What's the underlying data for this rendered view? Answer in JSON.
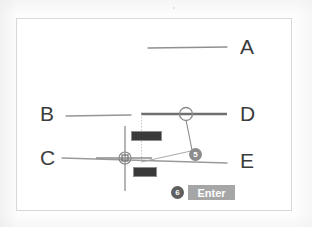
{
  "figure": {
    "background_color": "#ffffff",
    "line_color": "#8f8f8f",
    "highlight_line_color": "#6b6b6b",
    "label_color": "#3c3c3c",
    "marker_color": "#8c8c8c",
    "badge_background": "#3a3a3a",
    "button_background": "#a6a6a6"
  },
  "labels": [
    {
      "id": "A",
      "text": "A",
      "x": 240,
      "y": 44
    },
    {
      "id": "B",
      "text": "B",
      "x": 41,
      "y": 102
    },
    {
      "id": "C",
      "text": "C",
      "x": 41,
      "y": 146
    },
    {
      "id": "D",
      "text": "D",
      "x": 240,
      "y": 102
    },
    {
      "id": "E",
      "text": "E",
      "x": 240,
      "y": 146
    }
  ],
  "geometry": {
    "line_a": {
      "x1": 148,
      "y1": 48,
      "x2": 227,
      "y2": 47,
      "weight": 1.2
    },
    "line_b": {
      "x1": 66,
      "y1": 116,
      "x2": 131,
      "y2": 115,
      "weight": 1.2
    },
    "line_d": {
      "x1": 142,
      "y1": 114,
      "x2": 227,
      "y2": 114,
      "weight": 2.6
    },
    "line_ce": {
      "x1": 62,
      "y1": 159,
      "x2": 227,
      "y2": 163,
      "weight": 1.2
    },
    "cursor_vertical": {
      "x1": 125,
      "y1": 125,
      "x2": 125,
      "y2": 190,
      "weight": 1.2
    },
    "cursor_horizontal": {
      "x1": 95,
      "y1": 158,
      "x2": 150,
      "y2": 158,
      "weight": 1.2
    },
    "leader_box": {
      "x1": 142,
      "y1": 114,
      "x2": 142,
      "y2": 162,
      "weight": 0.8
    },
    "leader_diagonal": {
      "x1": 142,
      "y1": 162,
      "x2": 192,
      "y2": 150,
      "weight": 0.8
    },
    "leader_circle_drop": {
      "x1": 186,
      "y1": 118,
      "x2": 192,
      "y2": 150,
      "weight": 1.0
    }
  },
  "markers": {
    "crosshair_snap": {
      "name": "node-snap-crosshair",
      "cx": 125,
      "cy": 158,
      "r": 6
    },
    "circle_snap": {
      "name": "midpoint-snap-circle",
      "cx": 186,
      "cy": 114,
      "r": 6
    }
  },
  "badges": [
    {
      "id": "coord",
      "name": "dynamic-input-coordinate",
      "text": ""
    },
    {
      "id": "cmd",
      "name": "dynamic-input-command",
      "text": ""
    }
  ],
  "steps": [
    {
      "id": "5",
      "label": "5"
    },
    {
      "id": "6",
      "label": "6"
    }
  ],
  "button": {
    "label": "Enter"
  }
}
